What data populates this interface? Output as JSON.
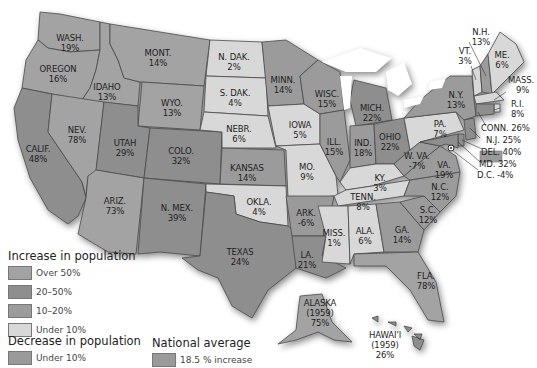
{
  "colors": {
    "over_50": "#a3a3a3",
    "range_20_50": "#8e8e8e",
    "range_10_20": "#9b9b9b",
    "under_10": "#d8d8d8",
    "decrease": "#9a9a9a",
    "national_average": "#9a9a9a",
    "water": "#ffffff"
  },
  "states": {
    "wash": {
      "name": "WASH.",
      "value": "19%"
    },
    "oregon": {
      "name": "OREGON",
      "value": "16%"
    },
    "calif": {
      "name": "CALIF.",
      "value": "48%"
    },
    "idaho": {
      "name": "IDAHO",
      "value": "13%"
    },
    "nev": {
      "name": "NEV.",
      "value": "78%"
    },
    "mont": {
      "name": "MONT.",
      "value": "14%"
    },
    "wyo": {
      "name": "WYO.",
      "value": "13%"
    },
    "utah": {
      "name": "UTAH",
      "value": "29%"
    },
    "ariz": {
      "name": "ARIZ.",
      "value": "73%"
    },
    "colo": {
      "name": "COLO.",
      "value": "32%"
    },
    "nmex": {
      "name": "N. MEX.",
      "value": "39%"
    },
    "ndak": {
      "name": "N. DAK.",
      "value": "2%"
    },
    "sdak": {
      "name": "S. DAK.",
      "value": "4%"
    },
    "nebr": {
      "name": "NEBR.",
      "value": "6%"
    },
    "kansas": {
      "name": "KANSAS",
      "value": "14%"
    },
    "okla": {
      "name": "OKLA.",
      "value": "4%"
    },
    "texas": {
      "name": "TEXAS",
      "value": "24%"
    },
    "minn": {
      "name": "MINN.",
      "value": "14%"
    },
    "iowa": {
      "name": "IOWA",
      "value": "5%"
    },
    "mo": {
      "name": "MO.",
      "value": "9%"
    },
    "ark": {
      "name": "ARK.",
      "value": "-6%"
    },
    "la": {
      "name": "LA.",
      "value": "21%"
    },
    "wisc": {
      "name": "WISC.",
      "value": "15%"
    },
    "ill": {
      "name": "ILL.",
      "value": "15%"
    },
    "mich": {
      "name": "MICH.",
      "value": "22%"
    },
    "ind": {
      "name": "IND.",
      "value": "18%"
    },
    "ohio": {
      "name": "OHIO",
      "value": "22%"
    },
    "ky": {
      "name": "KY.",
      "value": "3%"
    },
    "tenn": {
      "name": "TENN.",
      "value": "8%"
    },
    "miss": {
      "name": "MISS.",
      "value": "1%"
    },
    "ala": {
      "name": "ALA.",
      "value": "6%"
    },
    "ga": {
      "name": "GA.",
      "value": "14%"
    },
    "fla": {
      "name": "FLA.",
      "value": "78%"
    },
    "sc": {
      "name": "S.C.",
      "value": "12%"
    },
    "nc": {
      "name": "N.C.",
      "value": "12%"
    },
    "va": {
      "name": "VA.",
      "value": "19%"
    },
    "wva": {
      "name": "W. VA.",
      "value": "-7%"
    },
    "pa": {
      "name": "PA.",
      "value": "7%"
    },
    "ny": {
      "name": "N.Y.",
      "value": "13%"
    },
    "vt": {
      "name": "VT.",
      "value": "3%"
    },
    "nh": {
      "name": "N.H.",
      "value": "13%"
    },
    "me": {
      "name": "ME.",
      "value": "6%"
    },
    "mass": {
      "name": "MASS.",
      "value": "9%"
    },
    "ri": {
      "name": "R.I.",
      "value": "8%"
    },
    "conn": {
      "name": "CONN.",
      "value": "26%"
    },
    "nj": {
      "name": "N.J.",
      "value": "25%"
    },
    "del": {
      "name": "DEL.",
      "value": "40%"
    },
    "md": {
      "name": "MD.",
      "value": "32%"
    },
    "dc": {
      "name": "D.C.",
      "value": "-4%"
    },
    "alaska": {
      "name": "ALASKA",
      "year": "(1959)",
      "value": "75%"
    },
    "hawaii": {
      "name": "HAWAI'I",
      "year": "(1959)",
      "value": "26%"
    }
  },
  "legend": {
    "increase_title": "Increase in population",
    "increase_items": [
      {
        "label": "Over 50%"
      },
      {
        "label": "20–50%"
      },
      {
        "label": "10–20%"
      },
      {
        "label": "Under 10%"
      }
    ],
    "decrease_title": "Decrease in population",
    "decrease_items": [
      {
        "label": "Under 10%"
      }
    ],
    "national_title": "National average",
    "national_label": "18.5 % increase"
  }
}
